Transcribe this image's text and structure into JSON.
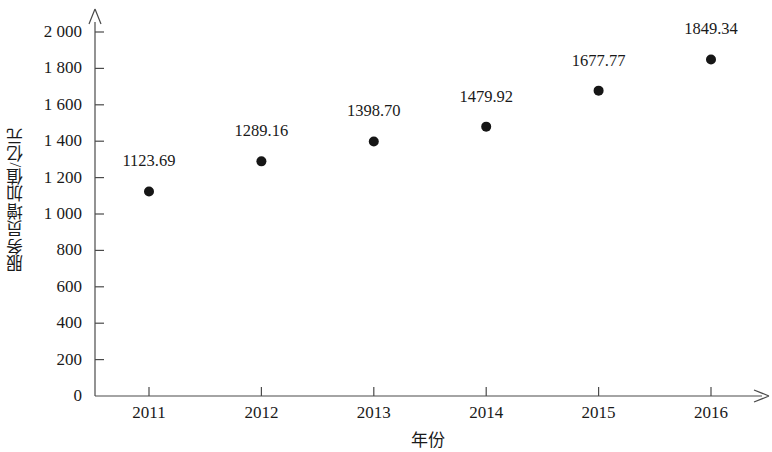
{
  "chart_data": {
    "type": "scatter",
    "title": "",
    "xlabel": "年份",
    "ylabel": "服务员增加值/亿元",
    "categories": [
      "2011",
      "2012",
      "2013",
      "2014",
      "2015",
      "2016"
    ],
    "x": [
      2011,
      2012,
      2013,
      2014,
      2015,
      2016
    ],
    "values": [
      1123.69,
      1289.16,
      1398.7,
      1479.92,
      1677.77,
      1849.34
    ],
    "point_labels": [
      "1123.69",
      "1289.16",
      "1398.70",
      "1479.92",
      "1677.77",
      "1849.34"
    ],
    "ylim": [
      0,
      2000
    ],
    "ytick_values": [
      0,
      200,
      400,
      600,
      800,
      1000,
      1200,
      1400,
      1600,
      1800,
      2000
    ],
    "ytick_labels": [
      "0",
      "200",
      "400",
      "600",
      "800",
      "1 000",
      "1 200",
      "1 400",
      "1 600",
      "1 800",
      "2 000"
    ],
    "grid": false,
    "legend": false,
    "legend_position": "none",
    "marker_color": "#161616",
    "axis_color": "#4a4a4a",
    "background_color": "#ffffff"
  },
  "axes": {
    "y_axis_name": "服务员增加值/亿元",
    "x_axis_name": "年份",
    "y_arrow": "up-arrow",
    "x_arrow": "right-arrow"
  }
}
